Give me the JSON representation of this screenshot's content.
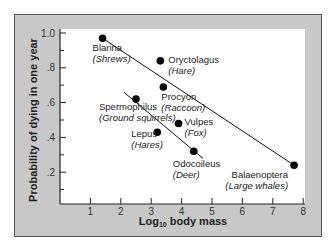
{
  "chart_data": {
    "type": "scatter",
    "title": "",
    "xlabel": "Log10 body mass",
    "xlabel_parts": {
      "prefix": "Log",
      "sub": "10",
      "suffix": " body mass"
    },
    "ylabel": "Probability of dying in one year",
    "xlim": [
      0,
      8
    ],
    "ylim": [
      0,
      1.0
    ],
    "x_ticks": [
      1,
      2,
      3,
      4,
      5,
      6,
      7,
      8
    ],
    "y_ticks": [
      {
        "value": 0.2,
        "label": ".2"
      },
      {
        "value": 0.4,
        "label": ".4"
      },
      {
        "value": 0.6,
        "label": ".6"
      },
      {
        "value": 0.8,
        "label": ".8"
      },
      {
        "value": 1.0,
        "label": "1.0"
      }
    ],
    "grid": false,
    "points": [
      {
        "genus": "Blarina",
        "common": "(Shrews)",
        "x": 1.4,
        "y": 0.97
      },
      {
        "genus": "Oryctolagus",
        "common": "(Hare)",
        "x": 3.3,
        "y": 0.84
      },
      {
        "genus": "Procyon",
        "common": "(Raccoon)",
        "x": 3.4,
        "y": 0.69
      },
      {
        "genus": "Spermophilus",
        "common": "(Ground squirrels)",
        "x": 2.5,
        "y": 0.62
      },
      {
        "genus": "Vulpes",
        "common": "(Fox)",
        "x": 3.9,
        "y": 0.48
      },
      {
        "genus": "Lepus",
        "common": "(Hares)",
        "x": 3.2,
        "y": 0.43
      },
      {
        "genus": "Odocoileus",
        "common": "(Deer)",
        "x": 4.4,
        "y": 0.32
      },
      {
        "genus": "Balaenoptera",
        "common": "(Large whales)",
        "x": 7.7,
        "y": 0.24
      }
    ],
    "trend_lines": [
      {
        "name": "upper",
        "from": [
          1.4,
          0.97
        ],
        "to": [
          7.7,
          0.24
        ]
      },
      {
        "name": "lower",
        "from": [
          2.1,
          0.66
        ],
        "to": [
          4.7,
          0.28
        ]
      }
    ]
  }
}
